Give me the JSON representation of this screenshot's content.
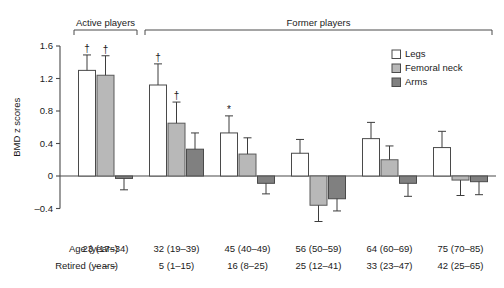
{
  "chart_data": {
    "type": "bar",
    "title": "",
    "subtitle": "",
    "xlabel": "",
    "ylabel": "BMD z scores",
    "ylim": [
      -0.4,
      1.6
    ],
    "yticks": [
      1.6,
      1.2,
      0.8,
      0.4,
      0,
      -0.4
    ],
    "ytick_labels": [
      "1.6",
      "1.2",
      "0.8",
      "0.4",
      "0",
      "–0.4"
    ],
    "grid": false,
    "legend_position": "top-right",
    "categories": [
      "23 (17–34)",
      "32 (19–39)",
      "45 (40–49)",
      "56 (50–59)",
      "64 (60–69)",
      "75 (70–85)"
    ],
    "series": [
      {
        "name": "Legs",
        "color": "#ffffff",
        "values": [
          1.3,
          1.12,
          0.53,
          0.28,
          0.46,
          0.35
        ],
        "errors": [
          0.19,
          0.26,
          0.21,
          0.17,
          0.2,
          0.2
        ],
        "markers": [
          "†",
          "†",
          "*",
          "",
          "",
          ""
        ]
      },
      {
        "name": "Femoral neck",
        "color": "#b8b8b8",
        "values": [
          1.24,
          0.65,
          0.27,
          -0.36,
          0.2,
          -0.05
        ],
        "errors": [
          0.24,
          0.26,
          0.2,
          0.2,
          0.17,
          0.19
        ],
        "markers": [
          "†",
          "†",
          "",
          "",
          "",
          ""
        ]
      },
      {
        "name": "Arms",
        "color": "#808080",
        "values": [
          -0.03,
          0.33,
          -0.09,
          -0.28,
          -0.09,
          -0.07
        ],
        "errors": [
          0.14,
          0.2,
          0.13,
          0.15,
          0.16,
          0.16
        ],
        "markers": [
          "",
          "",
          "",
          "",
          "",
          ""
        ]
      }
    ],
    "group_brackets": [
      {
        "label": "Active players",
        "from": 0,
        "to": 0
      },
      {
        "label": "Former players",
        "from": 1,
        "to": 5
      }
    ],
    "annotations": {
      "dagger": "†",
      "asterisk": "*"
    }
  },
  "legend": {
    "items": [
      {
        "label": "Legs",
        "swatch": "legs-swatch"
      },
      {
        "label": "Femoral neck",
        "swatch": "femoral-neck-swatch"
      },
      {
        "label": "Arms",
        "swatch": "arms-swatch"
      }
    ]
  },
  "table": {
    "rows": [
      {
        "label": "Age (years)",
        "values": [
          "23 (17–34)",
          "32 (19–39)",
          "45 (40–49)",
          "56 (50–59)",
          "64 (60–69)",
          "75 (70–85)"
        ]
      },
      {
        "label": "Retired (years)",
        "values": [
          "– – –",
          "5 (1–15)",
          "16 (8–25)",
          "25 (12–41)",
          "33 (23–47)",
          "42 (25–65)"
        ]
      }
    ]
  },
  "axis": {
    "ylabel": "BMD z scores",
    "ytick_labels": [
      "1.6",
      "1.2",
      "0.8",
      "0.4",
      "0",
      "–0.4"
    ]
  },
  "headers": {
    "active": "Active players",
    "former": "Former players"
  },
  "colors": {
    "legs": "#ffffff",
    "femoral_neck": "#b8b8b8",
    "arms": "#808080",
    "axis": "#4a4a4a",
    "text": "#1a1a1a"
  }
}
